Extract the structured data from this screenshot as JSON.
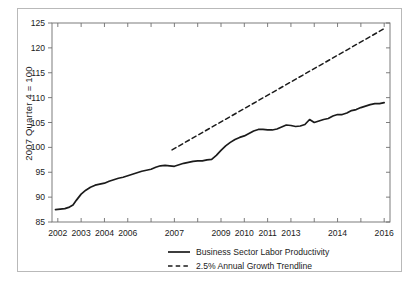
{
  "figure": {
    "background_color": "#ffffff",
    "border_color": "#b9b9b9",
    "axis_color": "#6e6e6e",
    "line_color": "#1b1b1b",
    "text_color": "#1b1b1b"
  },
  "axis": {
    "y_title": "2007 Quarter 4 = 100"
  },
  "legend": {
    "items": [
      {
        "label": "Business Sector Labor Productivity",
        "style": "solid"
      },
      {
        "label": "2.5% Annual Growth Trendline",
        "style": "dashed"
      }
    ]
  },
  "chart_data": {
    "type": "line",
    "title": "",
    "xlabel": "",
    "ylabel": "2007 Quarter 4 = 100",
    "xlim": [
      2001.75,
      2016.25
    ],
    "ylim": [
      85,
      125
    ],
    "yticks": [
      85,
      90,
      95,
      100,
      105,
      110,
      115,
      120,
      125
    ],
    "xticks": [
      2002,
      2003,
      2004,
      2005,
      2006,
      2007,
      2008,
      2009,
      2010,
      2011,
      2012,
      2013,
      2014,
      2015,
      2016
    ],
    "xtick_labels": [
      "2002",
      "2003",
      "2004",
      "2006",
      "2007",
      "",
      "2009",
      "2010",
      "2011",
      "2013",
      "2014",
      "2016"
    ],
    "xtick_label_values": [
      2002,
      2003,
      2004,
      2005,
      2007,
      2008,
      2009,
      2010,
      2011,
      2012,
      2014,
      2016
    ],
    "grid": false,
    "legend_position": "below-plot",
    "series": [
      {
        "name": "Business Sector Labor Productivity",
        "style": "solid",
        "color": "#1b1b1b",
        "x": [
          2001.9,
          2002.1,
          2002.3,
          2002.5,
          2002.65,
          2002.8,
          2003.0,
          2003.2,
          2003.4,
          2003.6,
          2003.8,
          2004.0,
          2004.2,
          2004.4,
          2004.6,
          2004.8,
          2005.0,
          2005.2,
          2005.4,
          2005.6,
          2005.8,
          2006.0,
          2006.2,
          2006.4,
          2006.6,
          2006.8,
          2007.0,
          2007.2,
          2007.4,
          2007.6,
          2007.8,
          2008.0,
          2008.2,
          2008.4,
          2008.6,
          2008.8,
          2009.0,
          2009.2,
          2009.4,
          2009.6,
          2009.8,
          2010.0,
          2010.2,
          2010.4,
          2010.6,
          2010.8,
          2011.0,
          2011.2,
          2011.4,
          2011.6,
          2011.8,
          2012.0,
          2012.2,
          2012.4,
          2012.6,
          2012.8,
          2013.0,
          2013.2,
          2013.4,
          2013.6,
          2013.8,
          2014.0,
          2014.2,
          2014.4,
          2014.6,
          2014.8,
          2015.0,
          2015.2,
          2015.4,
          2015.6,
          2015.8,
          2016.0
        ],
        "y": [
          87.5,
          87.6,
          87.7,
          88.0,
          88.4,
          89.4,
          90.6,
          91.4,
          92.0,
          92.4,
          92.6,
          92.8,
          93.2,
          93.5,
          93.8,
          94.0,
          94.3,
          94.6,
          94.9,
          95.2,
          95.4,
          95.6,
          96.0,
          96.3,
          96.4,
          96.3,
          96.2,
          96.5,
          96.8,
          97.0,
          97.2,
          97.3,
          97.3,
          97.5,
          97.6,
          98.4,
          99.4,
          100.3,
          101.0,
          101.6,
          102.0,
          102.3,
          102.8,
          103.3,
          103.6,
          103.6,
          103.5,
          103.5,
          103.7,
          104.1,
          104.5,
          104.4,
          104.2,
          104.3,
          104.6,
          105.6,
          105.0,
          105.3,
          105.6,
          105.8,
          106.3,
          106.6,
          106.6,
          106.9,
          107.4,
          107.6,
          108.0,
          108.3,
          108.6,
          108.8,
          108.8,
          109.0
        ]
      },
      {
        "name": "2.5% Annual Growth Trendline",
        "style": "dashed",
        "color": "#1b1b1b",
        "x": [
          2006.9,
          2016.05
        ],
        "y": [
          99.5,
          124.0
        ]
      }
    ]
  }
}
